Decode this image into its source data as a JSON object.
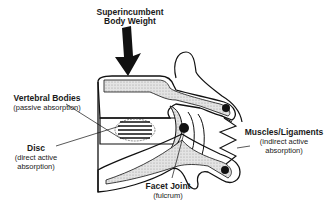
{
  "diagram": {
    "labels": {
      "load": {
        "line1": "Superincumbent",
        "line2": "Body Weight"
      },
      "vertebral_bodies": {
        "title": "Vertebral Bodies",
        "subtitle": "(passive absorption)"
      },
      "disc": {
        "title": "Disc",
        "subtitle1": "(direct active",
        "subtitle2": "absorption)"
      },
      "muscles": {
        "title": "Muscles/Ligaments",
        "subtitle1": "(indirect active",
        "subtitle2": "absorption)"
      },
      "facet": {
        "title": "Facet Joint",
        "subtitle": "(fulcrum)"
      }
    },
    "colors": {
      "stroke": "#111111",
      "fill_stipple": "#d6d6d6",
      "background": "#ffffff"
    }
  }
}
